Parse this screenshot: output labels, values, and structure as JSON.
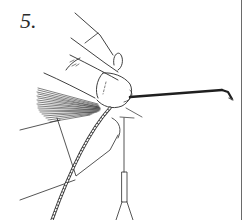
{
  "figure": {
    "step_label": "5.",
    "colors": {
      "line": "#2a2a2a",
      "background": "#ffffff",
      "border": "#6a6a6a"
    },
    "elements": [
      "thumb-and-finger",
      "hair-fiber-bundle",
      "hook-shank",
      "hook-eye",
      "tying-thread",
      "bobbin-tube",
      "page-border"
    ]
  }
}
